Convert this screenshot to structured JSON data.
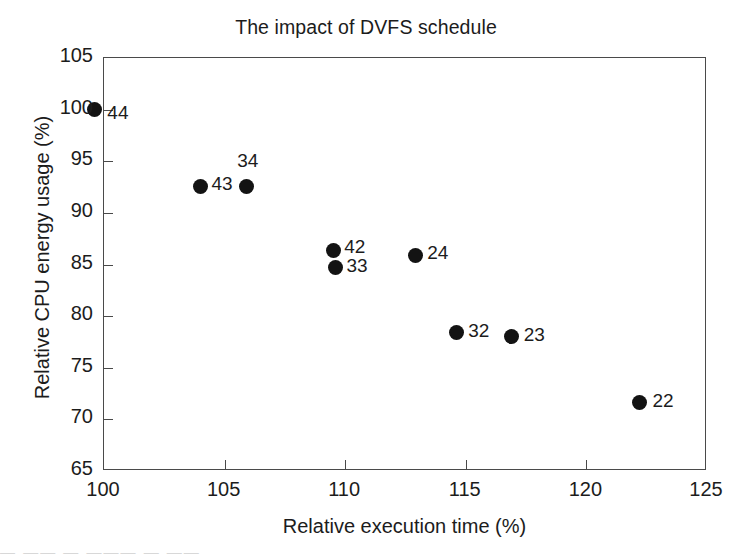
{
  "chart_data": {
    "type": "scatter",
    "title": "The impact of DVFS schedule",
    "xlabel": "Relative execution time (%)",
    "ylabel": "Relative CPU energy usage (%)",
    "xlim": [
      100,
      125
    ],
    "ylim": [
      65,
      105
    ],
    "xticks": [
      100,
      105,
      110,
      115,
      120,
      125
    ],
    "yticks": [
      65,
      70,
      75,
      80,
      85,
      90,
      95,
      100,
      105
    ],
    "grid": false,
    "legend": "none",
    "marker": "filled-circle",
    "marker_color": "#131313",
    "points": [
      {
        "label": "44",
        "x": 99.6,
        "y": 100.0,
        "label_dx": 14,
        "label_dy": 4
      },
      {
        "label": "43",
        "x": 104.0,
        "y": 92.6,
        "label_dx": 12,
        "label_dy": -1
      },
      {
        "label": "34",
        "x": 105.9,
        "y": 92.6,
        "label_dx": -8,
        "label_dy": -24
      },
      {
        "label": "42",
        "x": 109.5,
        "y": 86.4,
        "label_dx": 12,
        "label_dy": -2
      },
      {
        "label": "33",
        "x": 109.6,
        "y": 84.7,
        "label_dx": 12,
        "label_dy": -1
      },
      {
        "label": "24",
        "x": 112.9,
        "y": 85.9,
        "label_dx": 13,
        "label_dy": -1
      },
      {
        "label": "32",
        "x": 114.6,
        "y": 78.4,
        "label_dx": 13,
        "label_dy": -1
      },
      {
        "label": "23",
        "x": 116.9,
        "y": 78.0,
        "label_dx": 13,
        "label_dy": -1
      },
      {
        "label": "22",
        "x": 122.2,
        "y": 71.6,
        "label_dx": 14,
        "label_dy": -1
      }
    ]
  },
  "artifact": {
    "text": "—  —— —    ———  — ——"
  }
}
